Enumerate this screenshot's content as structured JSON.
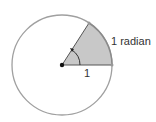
{
  "diagram": {
    "arc_label": "1 radian",
    "radius_label": "1",
    "colors": {
      "circle": "#9a9a9a",
      "sector_fill": "#c8c8c8",
      "radius_line": "#555555",
      "center_dot": "#111111"
    }
  }
}
